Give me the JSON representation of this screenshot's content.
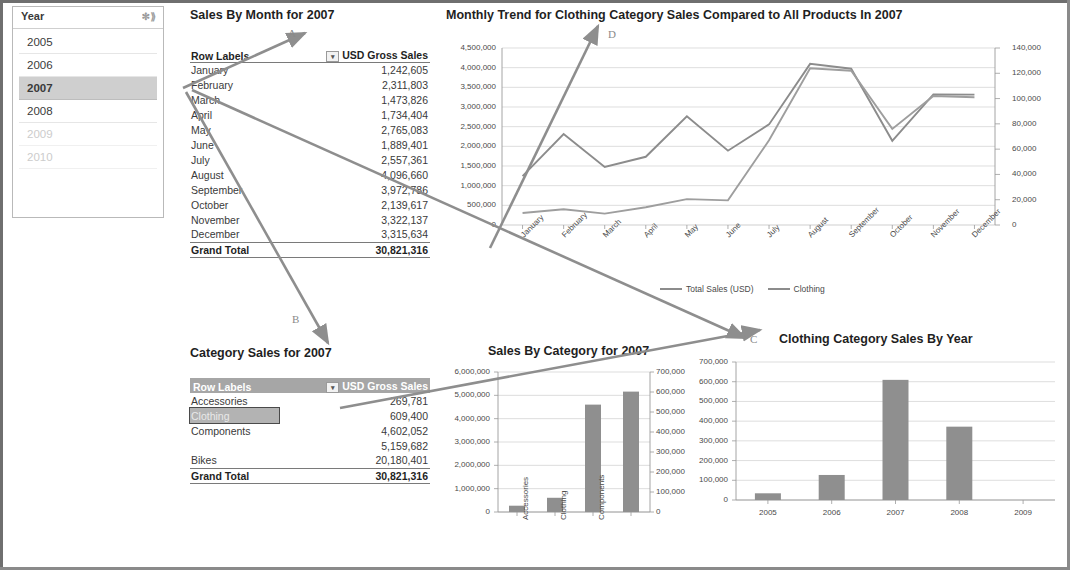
{
  "slicer": {
    "title": "Year",
    "clear_filter_icon": "clear-filter-icon",
    "items": [
      {
        "label": "2005",
        "state": "normal"
      },
      {
        "label": "2006",
        "state": "normal"
      },
      {
        "label": "2007",
        "state": "selected"
      },
      {
        "label": "2008",
        "state": "normal"
      },
      {
        "label": "2009",
        "state": "disabled"
      },
      {
        "label": "2010",
        "state": "disabled"
      }
    ]
  },
  "month_pivot": {
    "title": "Sales By Month for 2007",
    "headers": [
      "Row Labels",
      "USD Gross Sales"
    ],
    "rows": [
      {
        "label": "January",
        "value": "1,242,605"
      },
      {
        "label": "February",
        "value": "2,311,803"
      },
      {
        "label": "March",
        "value": "1,473,826"
      },
      {
        "label": "April",
        "value": "1,734,404"
      },
      {
        "label": "May",
        "value": "2,765,083"
      },
      {
        "label": "June",
        "value": "1,889,401"
      },
      {
        "label": "July",
        "value": "2,557,361"
      },
      {
        "label": "August",
        "value": "4,096,660"
      },
      {
        "label": "September",
        "value": "3,972,786"
      },
      {
        "label": "October",
        "value": "2,139,617"
      },
      {
        "label": "November",
        "value": "3,322,137"
      },
      {
        "label": "December",
        "value": "3,315,634"
      }
    ],
    "total": {
      "label": "Grand Total",
      "value": "30,821,316"
    }
  },
  "category_pivot": {
    "title": "Category Sales for 2007",
    "headers": [
      "Row Labels",
      "USD Gross Sales"
    ],
    "rows": [
      {
        "label": "Accessories",
        "value": "269,781",
        "selected": false
      },
      {
        "label": "Clothing",
        "value": "609,400",
        "selected": true
      },
      {
        "label": "Components",
        "value": "4,602,052",
        "selected": false
      },
      {
        "label": "",
        "value": "5,159,682",
        "selected": false
      },
      {
        "label": "Bikes",
        "value": "20,180,401",
        "selected": false
      }
    ],
    "total": {
      "label": "Grand Total",
      "value": "30,821,316"
    }
  },
  "arrows": [
    {
      "letter": "A"
    },
    {
      "letter": "B"
    },
    {
      "letter": "C"
    },
    {
      "letter": "D"
    }
  ],
  "chart_data": [
    {
      "id": "monthly_trend",
      "type": "line",
      "title": "Monthly Trend for Clothing Category Sales Compared to All Products In 2007",
      "categories": [
        "January",
        "February",
        "March",
        "April",
        "May",
        "June",
        "July",
        "August",
        "September",
        "October",
        "November",
        "December"
      ],
      "series": [
        {
          "name": "Total Sales (USD)",
          "axis": "left",
          "values": [
            1242605,
            2311803,
            1473826,
            1734404,
            2765083,
            1889401,
            2557361,
            4096660,
            3972786,
            2139617,
            3322137,
            3315634
          ]
        },
        {
          "name": "Clothing",
          "axis": "right",
          "values": [
            9500,
            12500,
            9000,
            14000,
            20500,
            19500,
            67000,
            124000,
            122000,
            76000,
            102000,
            101000
          ]
        }
      ],
      "ylim_left": [
        0,
        4500000
      ],
      "ytick_left": [
        "0",
        "500,000",
        "1,000,000",
        "1,500,000",
        "2,000,000",
        "2,500,000",
        "3,000,000",
        "3,500,000",
        "4,000,000",
        "4,500,000"
      ],
      "ylim_right": [
        0,
        140000
      ],
      "ytick_right": [
        "0",
        "20,000",
        "40,000",
        "60,000",
        "80,000",
        "100,000",
        "120,000",
        "140,000"
      ],
      "legend": [
        "Total Sales (USD)",
        "Clothing"
      ],
      "legend_position": "bottom",
      "grid": true
    },
    {
      "id": "sales_by_category",
      "type": "bar",
      "title": "Sales By Category for 2007",
      "categories": [
        "Accessories",
        "Clothing",
        "Components",
        ""
      ],
      "values": [
        269781,
        609400,
        4602052,
        5159682
      ],
      "ylim_left": [
        0,
        6000000
      ],
      "ytick_left": [
        "0",
        "1,000,000",
        "2,000,000",
        "3,000,000",
        "4,000,000",
        "5,000,000",
        "6,000,000"
      ],
      "ylim_right": [
        0,
        700000
      ],
      "ytick_right": [
        "0",
        "100,000",
        "200,000",
        "300,000",
        "400,000",
        "500,000",
        "600,000",
        "700,000"
      ],
      "grid": true
    },
    {
      "id": "clothing_by_year",
      "type": "bar",
      "title": "Clothing Category Sales By Year",
      "categories": [
        "2005",
        "2006",
        "2007",
        "2008",
        "2009"
      ],
      "values": [
        34000,
        127000,
        609400,
        372000,
        0
      ],
      "ylim": [
        0,
        700000
      ],
      "ytick": [
        "0",
        "100,000",
        "200,000",
        "300,000",
        "400,000",
        "500,000",
        "600,000",
        "700,000"
      ],
      "grid": true
    }
  ]
}
